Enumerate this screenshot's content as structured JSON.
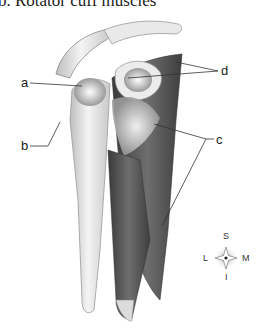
{
  "figure": {
    "title": "b. Rotator cuff muscles",
    "view": "posterior view of right shoulder (scapula, clavicle, humerus)",
    "labels": [
      {
        "id": "a",
        "text": "a"
      },
      {
        "id": "b",
        "text": "b"
      },
      {
        "id": "c",
        "text": "c"
      },
      {
        "id": "d",
        "text": "d"
      }
    ],
    "compass": {
      "superior": "S",
      "inferior": "I",
      "lateral": "L",
      "medial": "M"
    },
    "colors": {
      "bone": "#e6e6e6",
      "muscle_dark": "#4a4a4a",
      "muscle_mid": "#7a7a7a",
      "tendon": "#f2f2f2",
      "line": "#333333"
    }
  }
}
